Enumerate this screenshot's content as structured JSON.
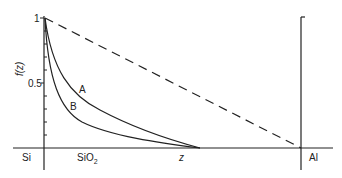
{
  "diagram": {
    "y_axis": {
      "label": "f(z)",
      "ticks": [
        {
          "value": "1",
          "label": "1"
        },
        {
          "value": "0.5",
          "label": "0.5"
        }
      ],
      "minor_tick_step": 0.1
    },
    "x_axis": {
      "label": "z"
    },
    "regions": {
      "left": "Si",
      "oxide": "SiO",
      "oxide_sub": "2",
      "right": "Al"
    },
    "curves": [
      {
        "name": "A",
        "label": "A",
        "style": "solid"
      },
      {
        "name": "B",
        "label": "B",
        "style": "solid"
      },
      {
        "name": "linear",
        "label": "",
        "style": "dashed"
      }
    ],
    "colors": {
      "line": "#222222",
      "background": "#ffffff"
    }
  }
}
